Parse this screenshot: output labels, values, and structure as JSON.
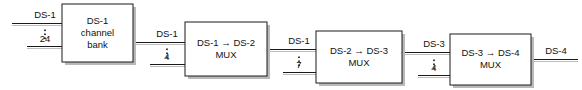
{
  "diagram": {
    "colors": {
      "line": "#1a1a1a",
      "shadow": "#b9b9b9",
      "background": "#ffffff",
      "text": "#111111"
    },
    "boxes": [
      {
        "id": "ds1-channel-bank",
        "lines": [
          "DS-1",
          "channel",
          "bank"
        ],
        "x": 62,
        "y": 4,
        "w": 71,
        "h": 58
      },
      {
        "id": "ds1-ds2-mux",
        "lines": [
          "DS-1 → DS-2",
          "MUX"
        ],
        "x": 185,
        "y": 22,
        "w": 82,
        "h": 54
      },
      {
        "id": "ds2-ds3-mux",
        "lines": [
          "DS-2 → DS-3",
          "MUX"
        ],
        "x": 316,
        "y": 31,
        "w": 86,
        "h": 52
      },
      {
        "id": "ds3-ds4-mux",
        "lines": [
          "DS-3 → DS-4",
          "MUX"
        ],
        "x": 450,
        "y": 34,
        "w": 81,
        "h": 51
      }
    ],
    "connections": [
      {
        "id": "input-to-channel-bank",
        "top_label": "DS-1",
        "bottom_label": "24",
        "top_line": {
          "x1": 12,
          "y1": 23,
          "x2": 62,
          "y2": 23
        },
        "bottom_line": {
          "x1": 27,
          "y1": 46,
          "x2": 62,
          "y2": 46
        },
        "dots_x": 45,
        "dots_y": 34,
        "top_label_x": 45,
        "top_label_y": 15,
        "bottom_label_x": 45,
        "bottom_label_y": 39
      },
      {
        "id": "channel-bank-to-ds1-ds2-mux",
        "top_label": "DS-1",
        "bottom_label": "4",
        "top_line": {
          "x1": 133,
          "y1": 42,
          "x2": 185,
          "y2": 42
        },
        "bottom_line": {
          "x1": 150,
          "y1": 64,
          "x2": 185,
          "y2": 64
        },
        "dots_x": 167,
        "dots_y": 53,
        "top_label_x": 167,
        "top_label_y": 34,
        "bottom_label_x": 167,
        "bottom_label_y": 57
      },
      {
        "id": "ds1-ds2-mux-to-ds2-ds3-mux",
        "top_label": "DS-1",
        "bottom_label": "7",
        "top_line": {
          "x1": 267,
          "y1": 49,
          "x2": 316,
          "y2": 49
        },
        "bottom_line": {
          "x1": 283,
          "y1": 72,
          "x2": 316,
          "y2": 72
        },
        "dots_x": 299,
        "dots_y": 61,
        "top_label_x": 299,
        "top_label_y": 41,
        "bottom_label_x": 299,
        "bottom_label_y": 65
      },
      {
        "id": "ds2-ds3-mux-to-ds3-ds4-mux",
        "top_label": "DS-3",
        "bottom_label": "4",
        "top_line": {
          "x1": 402,
          "y1": 52,
          "x2": 450,
          "y2": 52
        },
        "bottom_line": {
          "x1": 418,
          "y1": 75,
          "x2": 450,
          "y2": 75
        },
        "dots_x": 434,
        "dots_y": 64,
        "top_label_x": 434,
        "top_label_y": 44,
        "bottom_label_x": 434,
        "bottom_label_y": 68
      },
      {
        "id": "ds3-ds4-mux-output",
        "top_label": "DS-4",
        "bottom_label": "",
        "top_line": {
          "x1": 531,
          "y1": 59,
          "x2": 578,
          "y2": 59
        },
        "bottom_line": null,
        "dots_x": null,
        "dots_y": null,
        "top_label_x": 556,
        "top_label_y": 51,
        "bottom_label_x": null,
        "bottom_label_y": null
      }
    ]
  }
}
